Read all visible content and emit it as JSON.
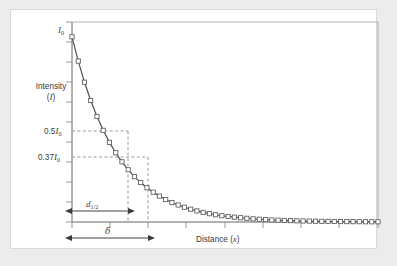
{
  "figure": {
    "axis_labels": {
      "y_title_line1": "Intensity",
      "y_title_line2": "(I)",
      "x_title": "Distance (x)",
      "y_top_label": "I0",
      "y_half_label": "0.5I0",
      "y_e_label": "0.37I0"
    },
    "annotations": {
      "d_half_label": "d1/2",
      "delta_label": "δ"
    },
    "colors": {
      "page_background": "#ececed",
      "card_background": "#ffffff",
      "card_border": "#d9d9da",
      "axis_line": "#8c8c8e",
      "curve_line": "#4a4a4c",
      "marker_stroke": "#5a5a5c",
      "marker_fill": "#ffffff",
      "dashed_line": "#8e8e90",
      "arrow_line": "#3a3a3c",
      "text": "#3a3a3c"
    }
  },
  "chart_data": {
    "type": "line",
    "title": "",
    "subtitle": "",
    "xlabel": "Distance (x)",
    "ylabel": "Intensity (I)",
    "xlim": [
      0,
      10
    ],
    "ylim": [
      0,
      1.08
    ],
    "grid": false,
    "legend": false,
    "legend_position": "none",
    "equation": "I = I0 * exp(-x / delta)",
    "decay_constant_delta": 1.45,
    "half_distance_d_half": 1.005,
    "x_tick_count": 8,
    "y_tick_count": 10,
    "x_tick_values": [
      0,
      1.25,
      2.5,
      3.75,
      5,
      6.25,
      7.5,
      8.75,
      10
    ],
    "y_tick_values": [
      0,
      0.1,
      0.2,
      0.3,
      0.4,
      0.5,
      0.6,
      0.7,
      0.8,
      0.9,
      1.0
    ],
    "tick_labels_shown": false,
    "reference_lines": [
      {
        "name": "half-intensity",
        "axis": "y",
        "value": 0.5,
        "label": "0.5I0",
        "style": "dashed"
      },
      {
        "name": "one-over-e-intensity",
        "axis": "y",
        "value": 0.37,
        "label": "0.37I0",
        "style": "dashed"
      },
      {
        "name": "d-half-dropline",
        "axis": "x",
        "value": 1.005,
        "style": "dashed"
      },
      {
        "name": "delta-dropline",
        "axis": "x",
        "value": 1.45,
        "style": "dashed"
      }
    ],
    "marker": "open-square",
    "marker_count": 50,
    "series": [
      {
        "name": "Intensity decay",
        "x": [
          0.0,
          0.204,
          0.408,
          0.612,
          0.816,
          1.02,
          1.224,
          1.429,
          1.633,
          1.837,
          2.041,
          2.245,
          2.449,
          2.653,
          2.857,
          3.061,
          3.265,
          3.469,
          3.673,
          3.878,
          4.082,
          4.286,
          4.49,
          4.694,
          4.898,
          5.102,
          5.306,
          5.51,
          5.714,
          5.918,
          6.122,
          6.327,
          6.531,
          6.735,
          6.939,
          7.143,
          7.347,
          7.551,
          7.755,
          7.959,
          8.163,
          8.367,
          8.571,
          8.776,
          8.98,
          9.184,
          9.388,
          9.592,
          9.796,
          10.0
        ],
        "y": [
          1.0,
          0.869,
          0.755,
          0.656,
          0.57,
          0.495,
          0.43,
          0.374,
          0.325,
          0.282,
          0.245,
          0.213,
          0.185,
          0.161,
          0.14,
          0.121,
          0.105,
          0.092,
          0.08,
          0.069,
          0.06,
          0.052,
          0.045,
          0.039,
          0.034,
          0.03,
          0.026,
          0.023,
          0.02,
          0.017,
          0.015,
          0.013,
          0.011,
          0.01,
          0.0086,
          0.0075,
          0.0065,
          0.0056,
          0.0049,
          0.0042,
          0.0037,
          0.0032,
          0.0028,
          0.0024,
          0.0021,
          0.0018,
          0.0016,
          0.0014,
          0.0012,
          0.001
        ]
      }
    ]
  }
}
